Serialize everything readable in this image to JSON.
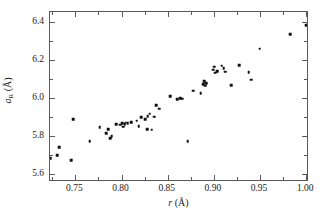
{
  "chart_data": {
    "type": "scatter",
    "title": "",
    "xlabel": "r (Å)",
    "ylabel": "aR (Å)",
    "xlabel_symbol": "r",
    "xlabel_unit": "(Å)",
    "ylabel_symbol": "a",
    "ylabel_subscript": "R",
    "ylabel_unit": "(Å)",
    "xlim": [
      0.7225,
      1.003
    ],
    "ylim": [
      5.555,
      6.455
    ],
    "grid": false,
    "legend": null,
    "marker": "square",
    "marker_color": "#101010",
    "frame_color": "#5a5a5a",
    "background": "#ffffff",
    "xticks": [
      0.75,
      0.8,
      0.85,
      0.9,
      0.95,
      1.0
    ],
    "xtick_labels": [
      "0.75",
      "0.80",
      "0.85",
      "0.90",
      "0.95",
      "1.00"
    ],
    "xticks_minor": [
      0.725,
      0.775,
      0.825,
      0.875,
      0.925,
      0.975
    ],
    "yticks": [
      5.6,
      5.8,
      6.0,
      6.2,
      6.4
    ],
    "ytick_labels": [
      "5.6",
      "5.8",
      "6.0",
      "6.2",
      "6.4"
    ],
    "yticks_minor": [
      5.7,
      5.9,
      6.1,
      6.3
    ],
    "points": [
      {
        "x": 0.7225,
        "y": 5.682
      },
      {
        "x": 0.7305,
        "y": 5.696
      },
      {
        "x": 0.7325,
        "y": 5.74
      },
      {
        "x": 0.7455,
        "y": 5.67
      },
      {
        "x": 0.7475,
        "y": 5.886
      },
      {
        "x": 0.7655,
        "y": 5.772
      },
      {
        "x": 0.7765,
        "y": 5.846
      },
      {
        "x": 0.7835,
        "y": 5.812
      },
      {
        "x": 0.7855,
        "y": 5.836
      },
      {
        "x": 0.7875,
        "y": 5.786
      },
      {
        "x": 0.7895,
        "y": 5.796
      },
      {
        "x": 0.7945,
        "y": 5.86
      },
      {
        "x": 0.7985,
        "y": 5.858
      },
      {
        "x": 0.8005,
        "y": 5.866
      },
      {
        "x": 0.8015,
        "y": 5.848
      },
      {
        "x": 0.8035,
        "y": 5.862
      },
      {
        "x": 0.8045,
        "y": 5.868
      },
      {
        "x": 0.8065,
        "y": 5.866
      },
      {
        "x": 0.8105,
        "y": 5.872
      },
      {
        "x": 0.8165,
        "y": 5.88
      },
      {
        "x": 0.8185,
        "y": 5.85
      },
      {
        "x": 0.8215,
        "y": 5.898
      },
      {
        "x": 0.8255,
        "y": 5.886
      },
      {
        "x": 0.8275,
        "y": 5.836
      },
      {
        "x": 0.8285,
        "y": 5.904
      },
      {
        "x": 0.8305,
        "y": 5.916
      },
      {
        "x": 0.8325,
        "y": 5.832
      },
      {
        "x": 0.8355,
        "y": 5.9
      },
      {
        "x": 0.8375,
        "y": 5.962
      },
      {
        "x": 0.8405,
        "y": 5.944
      },
      {
        "x": 0.8525,
        "y": 6.008
      },
      {
        "x": 0.8605,
        "y": 5.994
      },
      {
        "x": 0.8635,
        "y": 5.998
      },
      {
        "x": 0.8655,
        "y": 5.996
      },
      {
        "x": 0.8715,
        "y": 5.772
      },
      {
        "x": 0.8775,
        "y": 6.038
      },
      {
        "x": 0.8855,
        "y": 6.026
      },
      {
        "x": 0.8885,
        "y": 6.074
      },
      {
        "x": 0.8895,
        "y": 6.09
      },
      {
        "x": 0.8905,
        "y": 6.064
      },
      {
        "x": 0.8915,
        "y": 6.078
      },
      {
        "x": 0.8995,
        "y": 6.15
      },
      {
        "x": 0.9005,
        "y": 6.166
      },
      {
        "x": 0.9015,
        "y": 6.134
      },
      {
        "x": 0.9035,
        "y": 6.142
      },
      {
        "x": 0.9085,
        "y": 6.17
      },
      {
        "x": 0.9105,
        "y": 6.158
      },
      {
        "x": 0.9125,
        "y": 6.14
      },
      {
        "x": 0.9185,
        "y": 6.068
      },
      {
        "x": 0.9275,
        "y": 6.172
      },
      {
        "x": 0.9375,
        "y": 6.136
      },
      {
        "x": 0.9405,
        "y": 6.096
      },
      {
        "x": 0.9495,
        "y": 6.26
      },
      {
        "x": 0.9825,
        "y": 6.338
      },
      {
        "x": 1.0,
        "y": 6.384
      }
    ]
  }
}
